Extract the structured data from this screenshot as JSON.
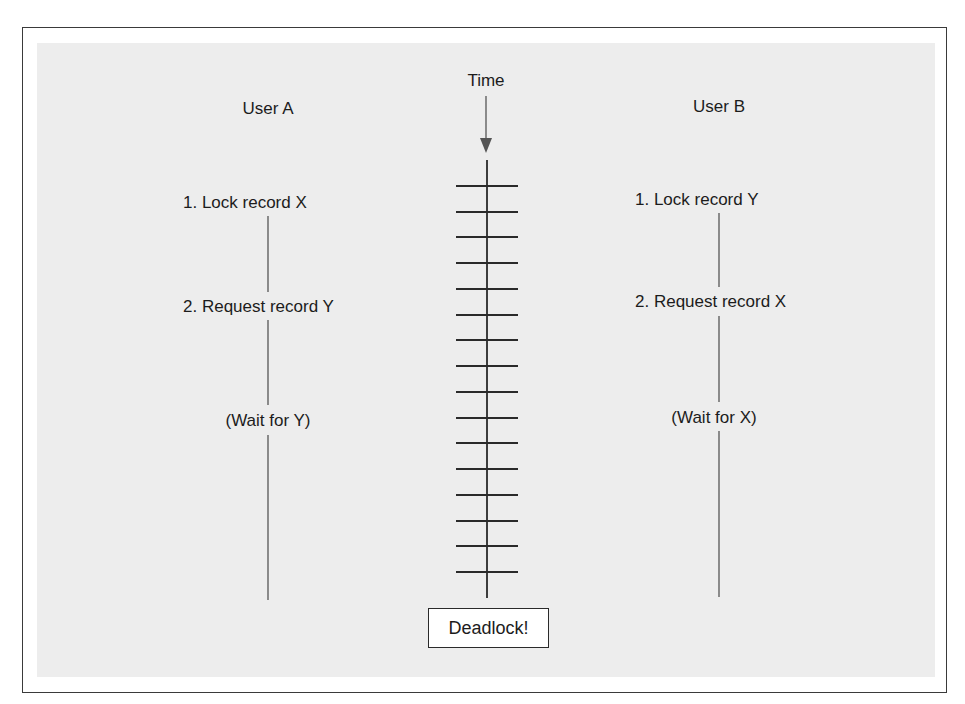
{
  "diagram": {
    "type": "deadlock-timeline",
    "time_label": "Time",
    "time_ticks": 16,
    "result_label": "Deadlock!",
    "users": [
      {
        "name": "User A",
        "steps": [
          "1. Lock record X",
          "2. Request record Y",
          "(Wait for Y)"
        ]
      },
      {
        "name": "User B",
        "steps": [
          "1. Lock record Y",
          "2. Request record X",
          "(Wait for X)"
        ]
      }
    ]
  },
  "colors": {
    "background": "#ffffff",
    "panel": "#ededed",
    "ink": "#1c1c1c",
    "line": "#555555"
  }
}
